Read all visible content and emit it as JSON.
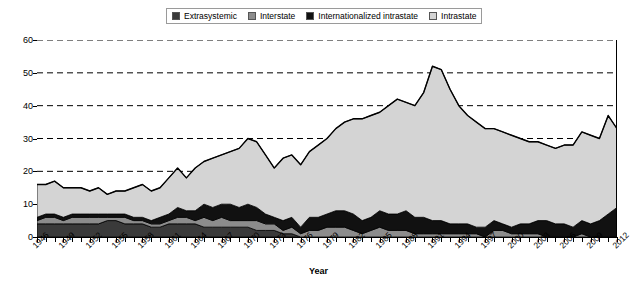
{
  "legend": {
    "position": "top-center",
    "items": [
      {
        "label": "Extrasystemic",
        "color": "#3a3a3a",
        "icon": "square-swatch"
      },
      {
        "label": "Interstate",
        "color": "#8c8c8c",
        "icon": "square-swatch"
      },
      {
        "label": "Internationalized intrastate",
        "color": "#111111",
        "icon": "square-swatch"
      },
      {
        "label": "Intrastate",
        "color": "#d4d4d4",
        "icon": "square-swatch"
      }
    ]
  },
  "axes": {
    "x_title": "Year",
    "y_title": "",
    "y_ticks": [
      0,
      10,
      20,
      30,
      40,
      50,
      60
    ],
    "x_ticks": [
      "1946",
      "1949",
      "1952",
      "1955",
      "1958",
      "1961",
      "1964",
      "1967",
      "1970",
      "1973",
      "1976",
      "1979",
      "1982",
      "1985",
      "1988",
      "1991",
      "1994",
      "1997",
      "2000",
      "2003",
      "2006",
      "2009",
      "2012"
    ],
    "grid": "horizontal-dashed"
  },
  "chart_data": {
    "type": "area",
    "title": "",
    "subtitle": "",
    "xlabel": "Year",
    "ylabel": "",
    "xlim": [
      1946,
      2012
    ],
    "ylim": [
      0,
      60
    ],
    "grid": true,
    "legend_position": "top-center",
    "stacked": true,
    "x": [
      1946,
      1947,
      1948,
      1949,
      1950,
      1951,
      1952,
      1953,
      1954,
      1955,
      1956,
      1957,
      1958,
      1959,
      1960,
      1961,
      1962,
      1963,
      1964,
      1965,
      1966,
      1967,
      1968,
      1969,
      1970,
      1971,
      1972,
      1973,
      1974,
      1975,
      1976,
      1977,
      1978,
      1979,
      1980,
      1981,
      1982,
      1983,
      1984,
      1985,
      1986,
      1987,
      1988,
      1989,
      1990,
      1991,
      1992,
      1993,
      1994,
      1995,
      1996,
      1997,
      1998,
      1999,
      2000,
      2001,
      2002,
      2003,
      2004,
      2005,
      2006,
      2007,
      2008,
      2009,
      2010,
      2011,
      2012
    ],
    "series": [
      {
        "name": "Extrasystemic",
        "color": "#3a3a3a",
        "values": [
          4,
          4,
          4,
          4,
          4,
          4,
          4,
          4,
          5,
          5,
          4,
          4,
          4,
          3,
          3,
          4,
          4,
          4,
          4,
          3,
          3,
          3,
          3,
          3,
          3,
          2,
          2,
          2,
          1,
          1,
          0,
          0,
          0,
          0,
          0,
          0,
          0,
          0,
          0,
          0,
          0,
          0,
          0,
          0,
          0,
          0,
          0,
          0,
          0,
          0,
          0,
          0,
          0,
          0,
          0,
          0,
          0,
          0,
          0,
          0,
          0,
          0,
          0,
          0,
          0,
          0,
          0
        ]
      },
      {
        "name": "Interstate",
        "color": "#8c8c8c",
        "values": [
          1,
          2,
          2,
          1,
          2,
          2,
          2,
          2,
          1,
          1,
          2,
          1,
          1,
          1,
          1,
          1,
          2,
          2,
          1,
          3,
          2,
          3,
          2,
          2,
          2,
          3,
          2,
          2,
          1,
          2,
          1,
          2,
          2,
          3,
          3,
          3,
          2,
          1,
          2,
          3,
          2,
          2,
          2,
          1,
          1,
          1,
          1,
          1,
          1,
          1,
          1,
          0,
          2,
          2,
          1,
          1,
          1,
          1,
          0,
          0,
          0,
          0,
          1,
          0,
          0,
          0,
          0
        ]
      },
      {
        "name": "Internationalized intrastate",
        "color": "#111111",
        "values": [
          1,
          1,
          1,
          1,
          1,
          1,
          1,
          1,
          1,
          1,
          1,
          1,
          1,
          1,
          2,
          2,
          3,
          2,
          3,
          4,
          4,
          4,
          5,
          4,
          5,
          4,
          3,
          2,
          3,
          3,
          2,
          4,
          4,
          4,
          5,
          5,
          5,
          4,
          4,
          5,
          5,
          5,
          6,
          5,
          5,
          4,
          4,
          3,
          3,
          3,
          2,
          3,
          3,
          2,
          2,
          3,
          3,
          4,
          5,
          4,
          4,
          3,
          4,
          4,
          5,
          7,
          9
        ]
      },
      {
        "name": "Intrastate",
        "color": "#d4d4d4",
        "values": [
          10,
          9,
          10,
          9,
          8,
          8,
          7,
          8,
          6,
          7,
          7,
          9,
          10,
          9,
          9,
          11,
          12,
          10,
          13,
          13,
          15,
          15,
          16,
          18,
          20,
          20,
          18,
          15,
          19,
          19,
          19,
          20,
          22,
          23,
          25,
          27,
          29,
          31,
          31,
          30,
          33,
          35,
          33,
          34,
          38,
          47,
          46,
          41,
          36,
          33,
          32,
          30,
          28,
          28,
          28,
          26,
          25,
          24,
          23,
          23,
          24,
          25,
          27,
          27,
          25,
          30,
          24
        ]
      }
    ],
    "totals": [
      16,
      16,
      17,
      15,
      15,
      15,
      14,
      15,
      13,
      14,
      14,
      15,
      16,
      14,
      15,
      18,
      21,
      18,
      21,
      23,
      24,
      25,
      26,
      27,
      30,
      29,
      25,
      21,
      24,
      25,
      22,
      26,
      28,
      30,
      33,
      35,
      36,
      36,
      37,
      38,
      40,
      42,
      41,
      40,
      44,
      52,
      51,
      45,
      40,
      37,
      35,
      33,
      33,
      32,
      31,
      30,
      29,
      29,
      28,
      27,
      28,
      28,
      32,
      31,
      30,
      37,
      33
    ]
  }
}
